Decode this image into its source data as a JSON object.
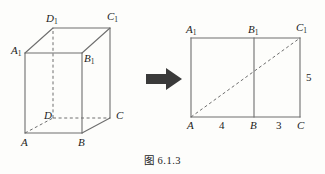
{
  "figure": {
    "caption": "图 6.1.3",
    "colors": {
      "background": "#fdfdfb",
      "stroke": "#6e6e6e",
      "text": "#1c1c1c",
      "arrow": "#3a3a3a"
    },
    "solid": {
      "name": "rectangular-cuboid",
      "vertices": [
        {
          "id": "A1",
          "base": "A",
          "sub": "1",
          "x": 25,
          "y": 53
        },
        {
          "id": "B1",
          "base": "B",
          "sub": "1",
          "x": 82,
          "y": 53
        },
        {
          "id": "C1",
          "base": "C",
          "sub": "1",
          "x": 110,
          "y": 28
        },
        {
          "id": "D1",
          "base": "D",
          "sub": "1",
          "x": 53,
          "y": 28
        },
        {
          "id": "A",
          "base": "A",
          "sub": "",
          "x": 25,
          "y": 133
        },
        {
          "id": "B",
          "base": "B",
          "sub": "",
          "x": 82,
          "y": 133
        },
        {
          "id": "C",
          "base": "C",
          "sub": "",
          "x": 110,
          "y": 118
        },
        {
          "id": "D",
          "base": "D",
          "sub": "",
          "x": 53,
          "y": 118
        }
      ],
      "labels": [
        {
          "base": "D",
          "sub": "1",
          "x": 46,
          "y": 13
        },
        {
          "base": "C",
          "sub": "1",
          "x": 107,
          "y": 11
        },
        {
          "base": "A",
          "sub": "1",
          "x": 11,
          "y": 45
        },
        {
          "base": "B",
          "sub": "1",
          "x": 80,
          "y": 52
        },
        {
          "base": "D",
          "sub": "",
          "x": 44,
          "y": 110
        },
        {
          "base": "C",
          "sub": "",
          "x": 116,
          "y": 110
        },
        {
          "base": "A",
          "sub": "",
          "x": 21,
          "y": 137
        },
        {
          "base": "B",
          "sub": "",
          "x": 78,
          "y": 137
        }
      ],
      "edges_solid": [
        "A1-B1",
        "B1-C1",
        "C1-D1",
        "D1-A1",
        "A-B",
        "B-C",
        "A1-A",
        "B1-B",
        "C1-C"
      ],
      "edges_hidden": [
        "A-D",
        "D-C",
        "D-D1"
      ]
    },
    "arrow": {
      "label": "transforms-to",
      "x": 146,
      "y": 68,
      "width": 36,
      "height": 22,
      "direction": "right"
    },
    "net": {
      "name": "unfolded-rectangle",
      "rect": {
        "left": 191,
        "top": 38,
        "right": 300,
        "bottom": 117
      },
      "divider_x": 254,
      "diagonal": {
        "from": "A",
        "to": "C1",
        "style": "dashed"
      },
      "labels": [
        {
          "base": "A",
          "sub": "1",
          "x": 186,
          "y": 26
        },
        {
          "base": "B",
          "sub": "1",
          "x": 248,
          "y": 26
        },
        {
          "base": "C",
          "sub": "1",
          "x": 296,
          "y": 24
        },
        {
          "base": "A",
          "sub": "",
          "x": 187,
          "y": 120
        },
        {
          "base": "B",
          "sub": "",
          "x": 250,
          "y": 120
        },
        {
          "base": "C",
          "sub": "",
          "x": 297,
          "y": 120
        }
      ],
      "measures": [
        {
          "value": "4",
          "x": 219,
          "y": 120,
          "edge": "A-B"
        },
        {
          "value": "3",
          "x": 276,
          "y": 120,
          "edge": "B-C"
        },
        {
          "value": "5",
          "x": 306,
          "y": 72,
          "edge": "C-C1"
        }
      ]
    }
  }
}
